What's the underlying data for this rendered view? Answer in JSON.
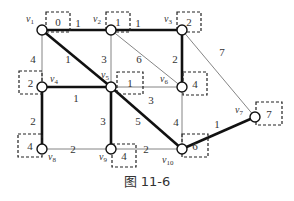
{
  "figure": {
    "caption": "图 11-6",
    "colors": {
      "line": "#333333",
      "background": "#ffffff"
    }
  },
  "nodes": [
    {
      "id": "v1",
      "label": "v1",
      "sub": "1",
      "x": 42,
      "y": 30,
      "value": "0",
      "box": [
        46,
        12,
        24,
        20
      ],
      "lx": 26,
      "ly": 22
    },
    {
      "id": "v2",
      "label": "v2",
      "sub": "2",
      "x": 111,
      "y": 30,
      "value": "1",
      "box": [
        106,
        12,
        24,
        20
      ],
      "lx": 93,
      "ly": 22
    },
    {
      "id": "v3",
      "label": "v3",
      "sub": "3",
      "x": 182,
      "y": 30,
      "value": "2",
      "box": [
        177,
        12,
        24,
        20
      ],
      "lx": 164,
      "ly": 22
    },
    {
      "id": "v4",
      "label": "v4",
      "sub": "4",
      "x": 42,
      "y": 87,
      "value": "2",
      "box": [
        19,
        71,
        23,
        23
      ],
      "lx": 50,
      "ly": 82
    },
    {
      "id": "v5",
      "label": "v5",
      "sub": "5",
      "x": 111,
      "y": 87,
      "value": "1",
      "box": [
        117,
        72,
        26,
        22
      ],
      "lx": 101,
      "ly": 78
    },
    {
      "id": "v6",
      "label": "v6",
      "sub": "6",
      "x": 182,
      "y": 87,
      "value": "4",
      "box": [
        183,
        72,
        24,
        23
      ],
      "lx": 160,
      "ly": 82
    },
    {
      "id": "v7",
      "label": "v7",
      "sub": "7",
      "x": 255,
      "y": 117,
      "value": "7",
      "box": [
        256,
        102,
        26,
        23
      ],
      "lx": 235,
      "ly": 113
    },
    {
      "id": "v8",
      "label": "v8",
      "sub": "8",
      "x": 42,
      "y": 149,
      "value": "4",
      "box": [
        18,
        134,
        24,
        23
      ],
      "lx": 48,
      "ly": 160
    },
    {
      "id": "v9",
      "label": "v9",
      "sub": "9",
      "x": 111,
      "y": 149,
      "value": "4",
      "box": [
        112,
        144,
        24,
        23
      ],
      "lx": 99,
      "ly": 160
    },
    {
      "id": "v10",
      "label": "v10",
      "sub": "10",
      "x": 182,
      "y": 149,
      "value": "6",
      "box": [
        182,
        134,
        26,
        23
      ],
      "lx": 162,
      "ly": 163
    }
  ],
  "edges": [
    {
      "from": "v1",
      "to": "v2",
      "weight": "1",
      "tree": true,
      "lx": 78,
      "ly": 27
    },
    {
      "from": "v2",
      "to": "v3",
      "weight": "1",
      "tree": true,
      "lx": 138,
      "ly": 27
    },
    {
      "from": "v1",
      "to": "v4",
      "weight": "4",
      "tree": false,
      "lx": 33,
      "ly": 63
    },
    {
      "from": "v1",
      "to": "v5",
      "weight": "1",
      "tree": true,
      "lx": 68,
      "ly": 63
    },
    {
      "from": "v2",
      "to": "v5",
      "weight": "3",
      "tree": false,
      "lx": 104,
      "ly": 63
    },
    {
      "from": "v2",
      "to": "v6",
      "weight": "6",
      "tree": false,
      "lx": 139,
      "ly": 63
    },
    {
      "from": "v3",
      "to": "v6",
      "weight": "2",
      "tree": true,
      "lx": 175,
      "ly": 63
    },
    {
      "from": "v3",
      "to": "v7",
      "weight": "7",
      "tree": false,
      "lx": 222,
      "ly": 56
    },
    {
      "from": "v4",
      "to": "v5",
      "weight": "1",
      "tree": true,
      "lx": 76,
      "ly": 102
    },
    {
      "from": "v5",
      "to": "v6",
      "weight": "3",
      "tree": false,
      "lx": 151,
      "ly": 104
    },
    {
      "from": "v4",
      "to": "v8",
      "weight": "2",
      "tree": true,
      "lx": 33,
      "ly": 125
    },
    {
      "from": "v5",
      "to": "v9",
      "weight": "3",
      "tree": true,
      "lx": 103,
      "ly": 125
    },
    {
      "from": "v5",
      "to": "v10",
      "weight": "5",
      "tree": true,
      "lx": 138,
      "ly": 125
    },
    {
      "from": "v6",
      "to": "v10",
      "weight": "4",
      "tree": false,
      "lx": 176,
      "ly": 126
    },
    {
      "from": "v7",
      "to": "v10",
      "weight": "1",
      "tree": true,
      "lx": 217,
      "ly": 128
    },
    {
      "from": "v8",
      "to": "v9",
      "weight": "2",
      "tree": false,
      "lx": 73,
      "ly": 153
    },
    {
      "from": "v9",
      "to": "v10",
      "weight": "2",
      "tree": false,
      "lx": 146,
      "ly": 153
    }
  ]
}
